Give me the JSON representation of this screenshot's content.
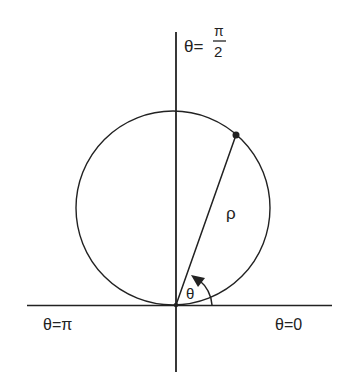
{
  "diagram": {
    "title": "",
    "type": "polar-coordinate-circle",
    "labels": {
      "theta_half_pi_prefix": "θ=",
      "half_pi_numerator": "π",
      "half_pi_denominator": "2",
      "theta_pi": "θ=π",
      "theta_zero": "θ=0",
      "rho": "ρ",
      "theta": "θ"
    },
    "colors": {
      "ink": "#222222",
      "background": "#ffffff"
    },
    "geometry": {
      "origin": [
        176,
        305
      ],
      "circle_center": [
        173,
        208
      ],
      "circle_radius": 97,
      "point_on_circle": [
        236,
        135
      ],
      "horizontal_axis": [
        27,
        332
      ],
      "vertical_axis": [
        32,
        372
      ]
    }
  }
}
